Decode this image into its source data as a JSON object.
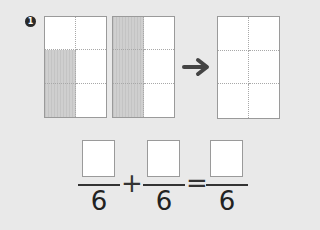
{
  "problem": {
    "number": "1",
    "grids": [
      {
        "name": "grid-1",
        "shaded": [
          false,
          false,
          true,
          false,
          true,
          false
        ]
      },
      {
        "name": "grid-2",
        "shaded": [
          true,
          false,
          true,
          false,
          true,
          false
        ]
      },
      {
        "name": "grid-result",
        "shaded": [
          false,
          false,
          false,
          false,
          false,
          false
        ]
      }
    ],
    "arrow_icon": "right-arrow-icon",
    "equation": {
      "fractions": [
        {
          "numerator": "",
          "denominator": "6"
        },
        {
          "numerator": "",
          "denominator": "6"
        },
        {
          "numerator": "",
          "denominator": "6"
        }
      ],
      "operators": [
        "+",
        "="
      ]
    }
  },
  "colors": {
    "background": "#e9e9e9",
    "shaded": "#cfcfcf",
    "badge": "#2a2a2a",
    "arrow": "#444444"
  }
}
